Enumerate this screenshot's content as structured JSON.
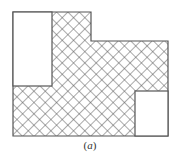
{
  "figure": {
    "caption_open": "(",
    "caption_letter": "a",
    "caption_close": ")",
    "colors": {
      "stroke": "#555555",
      "hatch": "#555555",
      "background": "#ffffff",
      "hole_fill": "#ffffff"
    },
    "outline": [
      [
        13,
        12
      ],
      [
        91,
        12
      ],
      [
        91,
        41
      ],
      [
        168,
        41
      ],
      [
        168,
        136
      ],
      [
        13,
        136
      ]
    ],
    "holes": [
      {
        "name": "left-blank-region",
        "x": 13,
        "y": 12,
        "w": 39,
        "h": 74
      },
      {
        "name": "right-blank-region",
        "x": 135,
        "y": 91,
        "w": 33,
        "h": 45
      }
    ],
    "hatch": {
      "pattern": "crosshatch",
      "spacing": 8,
      "angle": 45
    }
  }
}
